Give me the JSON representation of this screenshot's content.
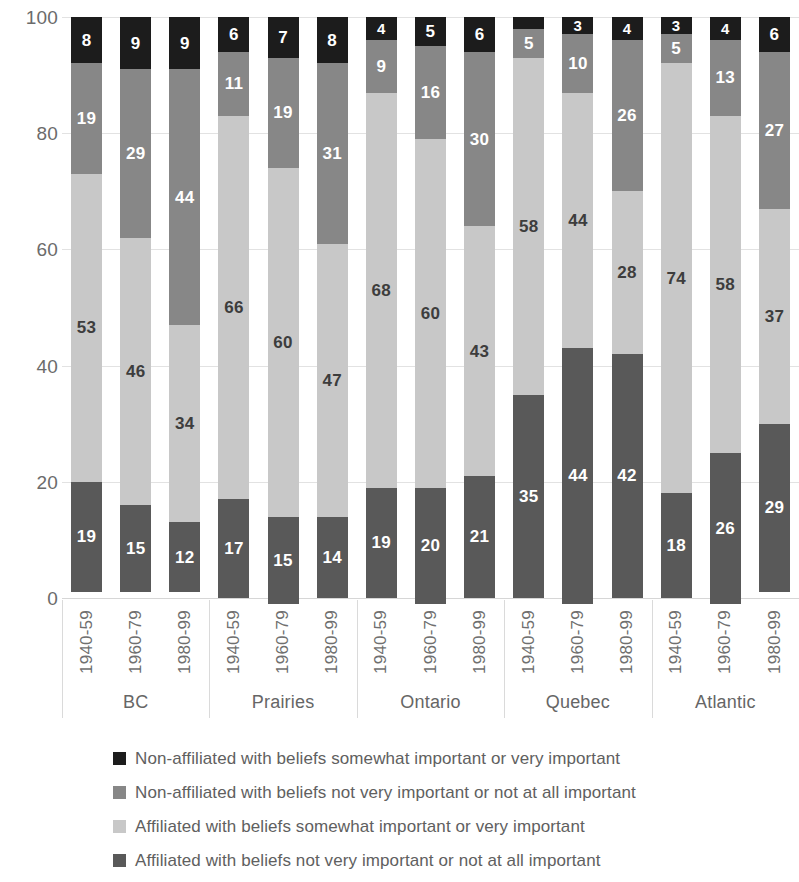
{
  "chart_data": {
    "type": "bar",
    "subtype": "stacked-bar-100",
    "title": "",
    "subtitle": "",
    "xlabel": "",
    "ylabel": "",
    "ylim": [
      0,
      100
    ],
    "yticks": [
      "0",
      "20",
      "40",
      "60",
      "80",
      "100"
    ],
    "grid": true,
    "legend_position": "bottom",
    "groups": [
      "BC",
      "Prairies",
      "Ontario",
      "Quebec",
      "Atlantic"
    ],
    "categories": [
      "1940-59",
      "1960-79",
      "1980-99",
      "1940-59",
      "1960-79",
      "1980-99",
      "1940-59",
      "1960-79",
      "1980-99",
      "1940-59",
      "1960-79",
      "1980-99",
      "1940-59",
      "1960-79",
      "1980-99"
    ],
    "series": [
      {
        "name": "Affiliated with beliefs not very important or not at all important",
        "color": "#595959",
        "values": [
          19,
          15,
          12,
          17,
          15,
          14,
          19,
          20,
          21,
          35,
          44,
          42,
          18,
          26,
          29
        ]
      },
      {
        "name": "Affiliated with beliefs somewhat important or very important",
        "color": "#c8c8c8",
        "values": [
          53,
          46,
          34,
          66,
          60,
          47,
          68,
          60,
          43,
          58,
          44,
          28,
          74,
          58,
          37
        ]
      },
      {
        "name": "Non-affiliated with beliefs not very important or not at all important",
        "color": "#878787",
        "values": [
          19,
          29,
          44,
          11,
          19,
          31,
          9,
          16,
          30,
          5,
          10,
          26,
          5,
          13,
          27
        ]
      },
      {
        "name": "Non-affiliated with beliefs somewhat important or very important",
        "color": "#1c1c1c",
        "values": [
          8,
          9,
          9,
          6,
          7,
          8,
          4,
          5,
          6,
          2,
          3,
          4,
          3,
          4,
          6
        ]
      }
    ]
  },
  "legend": {
    "items": [
      {
        "label": "Non-affiliated with beliefs somewhat important or very important",
        "color": "#1c1c1c"
      },
      {
        "label": "Non-affiliated with beliefs not very important or not at all important",
        "color": "#878787"
      },
      {
        "label": "Affiliated with beliefs somewhat important or very important",
        "color": "#c8c8c8"
      },
      {
        "label": "Affiliated with beliefs not very important or not at all important",
        "color": "#595959"
      }
    ]
  }
}
